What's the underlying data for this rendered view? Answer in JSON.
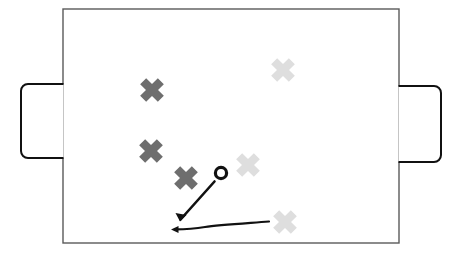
{
  "diagram": {
    "background_color": "#ffffff"
  },
  "pitch": {
    "name": "playing-field",
    "x": 63,
    "y": 9,
    "width": 336,
    "height": 234,
    "fill_color": "#ffffff",
    "stroke_color": "#5a5a5a",
    "stroke_width": 1.4
  },
  "goals": [
    {
      "id": "goal-left",
      "label": "Left goal",
      "x": 21,
      "y": 84,
      "width": 42,
      "height": 74,
      "corner_radius": 7,
      "flat_side": "right",
      "stroke_color": "#111111",
      "stroke_width": 2,
      "fill_color": "#ffffff"
    },
    {
      "id": "goal-right",
      "label": "Right goal",
      "x": 399,
      "y": 86,
      "width": 42,
      "height": 76,
      "corner_radius": 7,
      "flat_side": "left",
      "stroke_color": "#111111",
      "stroke_width": 2,
      "fill_color": "#ffffff"
    }
  ],
  "players": {
    "dark_team": {
      "label": "Dark team",
      "color": "#6e6e6e",
      "marker": "cross-marker",
      "markers": [
        {
          "id": "dark-player-1",
          "cx": 152,
          "cy": 90,
          "size": 25,
          "arm": 8.5,
          "rotation": 45
        },
        {
          "id": "dark-player-2",
          "cx": 151,
          "cy": 151,
          "size": 25,
          "arm": 8.5,
          "rotation": 45
        },
        {
          "id": "dark-player-3",
          "cx": 186,
          "cy": 178,
          "size": 25,
          "arm": 8.5,
          "rotation": 45
        }
      ]
    },
    "light_team": {
      "label": "Light team",
      "color": "#dedede",
      "marker": "cross-marker",
      "markers": [
        {
          "id": "light-player-1",
          "cx": 283,
          "cy": 70,
          "size": 25,
          "arm": 8.5,
          "rotation": 45
        },
        {
          "id": "light-player-2",
          "cx": 248,
          "cy": 165,
          "size": 25,
          "arm": 8.5,
          "rotation": 45
        },
        {
          "id": "light-player-3",
          "cx": 285,
          "cy": 222,
          "size": 25,
          "arm": 8.5,
          "rotation": 45
        }
      ]
    }
  },
  "ball": {
    "id": "ball-marker",
    "label": "Ball",
    "cx": 221,
    "cy": 173,
    "radius": 5.6,
    "stroke_color": "#111111",
    "stroke_width": 3.2,
    "fill_color": "#ffffff"
  },
  "arrows": [
    {
      "id": "arrow-pass-diagonal",
      "label": "Diagonal pass arrow",
      "path": "M 214.5 181.5 L 180.5 219.5",
      "stroke_color": "#111111",
      "stroke_width": 2.6,
      "head_at": "end",
      "head_points": "180.0,221.5 186.5,215.0 175.5,213.0",
      "head_rotation": 228
    },
    {
      "id": "arrow-run-horizontal",
      "label": "Horizontal run arrow",
      "path": "M 269 221.5 C 243 223.5 218 225 205 227 C 196 228.4 186 229.2 175 229.4",
      "stroke_color": "#111111",
      "stroke_width": 2.2,
      "head_at": "end",
      "head_points": "171.0,229.5 178.5,226.0 178.5,233.0",
      "head_rotation": 180
    }
  ]
}
